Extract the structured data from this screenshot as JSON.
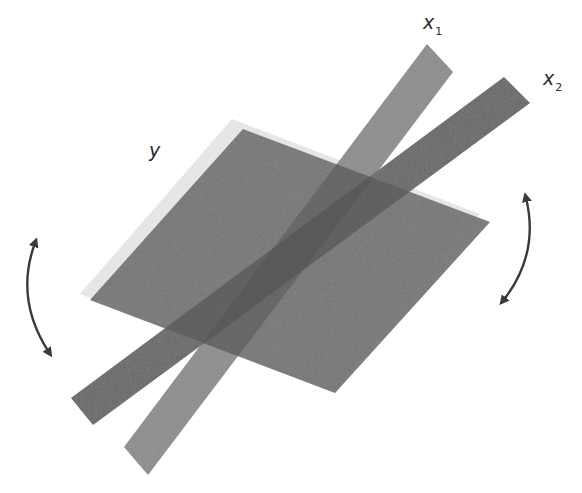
{
  "figure": {
    "labels": {
      "plane": {
        "main": "y",
        "sub": ""
      },
      "strip1": {
        "main": "x",
        "sub": "1"
      },
      "strip2": {
        "main": "x",
        "sub": "2"
      }
    },
    "colors": {
      "background": "#ffffff",
      "plane_fill": "#6f6f6f",
      "plane_halo": "#e6e6e6",
      "strip1_fill": "#8c8c8c",
      "strip2_fill": "#666666",
      "overlap_fill": "#555555",
      "arrow_color": "#3a3a3a",
      "label_color": "#2b2b2b"
    },
    "arrows": [
      {
        "name": "left-rotation-arrow",
        "type": "double-headed-curved"
      },
      {
        "name": "right-rotation-arrow",
        "type": "double-headed-curved"
      }
    ]
  }
}
